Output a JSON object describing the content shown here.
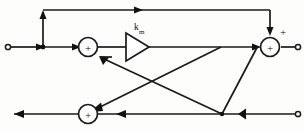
{
  "diagram": {
    "type": "signal-flow-block-diagram",
    "background_color": "#fdfdfc",
    "line_color": "#1a1a1a",
    "blocks": {
      "amplifier": {
        "shape": "triangle",
        "gain_symbol": "k",
        "gain_subscript": "m",
        "gain_label": "km",
        "points_direction": "right"
      },
      "summing_junction_left": {
        "symbol": "+",
        "shape": "circle"
      },
      "summing_junction_right": {
        "symbol": "+",
        "shape": "circle",
        "external_sign": "+"
      },
      "summing_junction_bottom": {
        "symbol": "+",
        "shape": "circle"
      }
    },
    "terminals": {
      "input_left": "open-port",
      "output_right": "open-port",
      "output_bottom_right": "open-port"
    }
  }
}
